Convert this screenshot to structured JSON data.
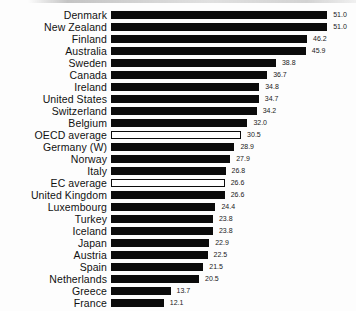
{
  "chart_data": {
    "type": "bar",
    "orientation": "horizontal",
    "title": "",
    "xlabel": "",
    "ylabel": "",
    "xlim": [
      0,
      52
    ],
    "grid": false,
    "legend": false,
    "bar_color": "#0b0b0b",
    "outlined_bar_fill": "#ffffff",
    "outlined_bar_border": "#0b0b0b",
    "categories": [
      "Denmark",
      "New Zealand",
      "Finland",
      "Australia",
      "Sweden",
      "Canada",
      "Ireland",
      "United States",
      "Switzerland",
      "Belgium",
      "OECD average",
      "Germany (W)",
      "Norway",
      "Italy",
      "EC average",
      "United Kingdom",
      "Luxembourg",
      "Turkey",
      "Iceland",
      "Japan",
      "Austria",
      "Spain",
      "Netherlands",
      "Greece",
      "France"
    ],
    "values": [
      51.0,
      51.0,
      46.2,
      45.9,
      38.8,
      36.7,
      34.8,
      34.7,
      34.2,
      32.0,
      30.5,
      28.9,
      27.9,
      26.8,
      26.6,
      26.6,
      24.4,
      23.8,
      23.8,
      22.9,
      22.5,
      21.5,
      20.5,
      13.7,
      12.1
    ],
    "value_labels": [
      "51.0",
      "51.0",
      "46.2",
      "45.9",
      "38.8",
      "36.7",
      "34.8",
      "34.7",
      "34.2",
      "32.0",
      "30.5",
      "28.9",
      "27.9",
      "26.8",
      "26.6",
      "26.6",
      "24.4",
      "23.8",
      "23.8",
      "22.9",
      "22.5",
      "21.5",
      "20.5",
      "13.7",
      "12.1"
    ],
    "outlined_categories": [
      "OECD average",
      "EC average"
    ]
  }
}
